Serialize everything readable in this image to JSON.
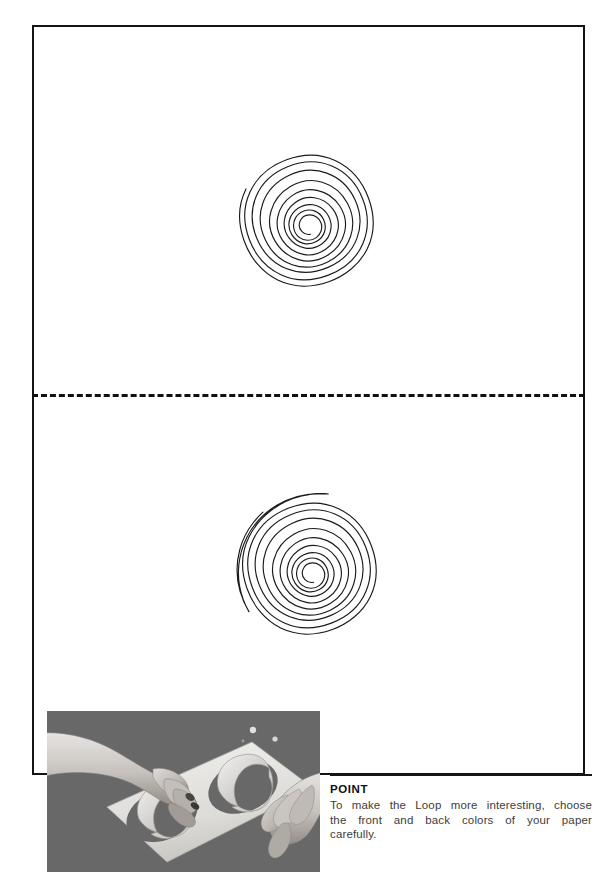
{
  "page": {
    "background_color": "#ffffff",
    "frame": {
      "name": "template-frame",
      "border_color": "#141414",
      "border_width_px": 2
    },
    "cut_line": {
      "name": "dashed-cut-line",
      "style": "dashed",
      "color": "#111111",
      "label": ""
    }
  },
  "templates": [
    {
      "id": "spiral-top",
      "label": "Spiral cutting template (upper)",
      "shape": "archimedean-spiral",
      "turns": 3.5,
      "stroke_color": "#1b1b1b"
    },
    {
      "id": "spiral-bottom",
      "label": "Spiral cutting template (lower)",
      "shape": "archimedean-spiral",
      "turns": 3.5,
      "stroke_color": "#1b1b1b"
    }
  ],
  "photo": {
    "name": "instruction-photograph",
    "caption": "",
    "alt": "Two hands assembling paper loops through oval cutouts in a white card on a grey surface",
    "background_color": "#6e6e6e",
    "card_color": "#ededea"
  },
  "point": {
    "title": "POINT",
    "line1": "To make the Loop more interesting, choose",
    "line2": "the front and back colors of your paper",
    "line3": "carefully.",
    "text_color": "#3c3c3c",
    "title_color": "#101010"
  }
}
